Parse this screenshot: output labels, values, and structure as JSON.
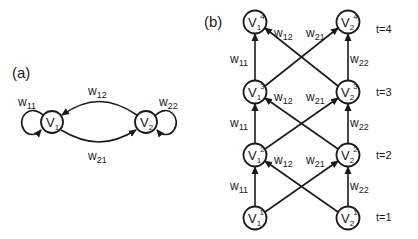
{
  "panels": {
    "a": {
      "label": "(a)",
      "nodes": [
        {
          "id": "V1",
          "base": "V",
          "sub": "1"
        },
        {
          "id": "V2",
          "base": "V",
          "sub": "2"
        }
      ],
      "edges": [
        {
          "from": "V1",
          "to": "V1",
          "label": "w",
          "sub": "11"
        },
        {
          "from": "V2",
          "to": "V1",
          "label": "w",
          "sub": "12"
        },
        {
          "from": "V1",
          "to": "V2",
          "label": "w",
          "sub": "21"
        },
        {
          "from": "V2",
          "to": "V2",
          "label": "w",
          "sub": "22"
        }
      ]
    },
    "b": {
      "label": "(b)",
      "time_labels": [
        "t=4",
        "t=3",
        "t=2",
        "t=1"
      ],
      "nodes": [
        {
          "id": "V1^4",
          "base": "V",
          "sub": "1",
          "sup": "4"
        },
        {
          "id": "V2^4",
          "base": "V",
          "sub": "2",
          "sup": "4"
        },
        {
          "id": "V1^3",
          "base": "V",
          "sub": "1",
          "sup": "3"
        },
        {
          "id": "V2^3",
          "base": "V",
          "sub": "2",
          "sup": "3"
        },
        {
          "id": "V1^2",
          "base": "V",
          "sub": "1",
          "sup": "2"
        },
        {
          "id": "V2^2",
          "base": "V",
          "sub": "2",
          "sup": "2"
        },
        {
          "id": "V1^1",
          "base": "V",
          "sub": "1",
          "sup": "1"
        },
        {
          "id": "V2^1",
          "base": "V",
          "sub": "2",
          "sup": "1"
        }
      ],
      "layer_labels": [
        {
          "w11": "11",
          "w12": "12",
          "w21": "21",
          "w22": "22"
        },
        {
          "w11": "11",
          "w12": "12",
          "w21": "21",
          "w22": "22"
        },
        {
          "w11": "11",
          "w12": "12",
          "w21": "21",
          "w22": "22"
        }
      ],
      "w": "w"
    }
  }
}
